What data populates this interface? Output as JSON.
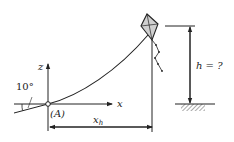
{
  "diagram": {
    "type": "kite-height-problem",
    "labels": {
      "z_axis": "z",
      "x_axis": "x",
      "origin": "(A)",
      "angle": "10°",
      "horizontal_distance": "x_h",
      "horizontal_distance_main": "x",
      "horizontal_distance_sub": "h",
      "height": "h = ?"
    },
    "colors": {
      "stroke": "#222222",
      "kite_fill": "#d0d0d0",
      "background": "#ffffff"
    }
  }
}
